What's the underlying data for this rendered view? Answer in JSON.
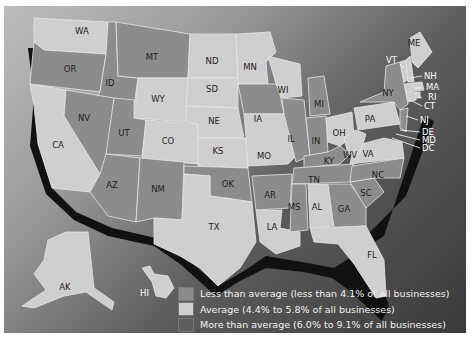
{
  "map": {
    "title": "Share of businesses by state",
    "colors": {
      "less": "#8c8c8c",
      "average": "#cfcfcf",
      "more": "#5e5e5e",
      "coast_shadow": "#111111",
      "background_light": "#bdbdbd",
      "background_dark": "#3a3a3a"
    },
    "states": {
      "WA": {
        "label": "WA",
        "category": "average"
      },
      "OR": {
        "label": "OR",
        "category": "less"
      },
      "CA": {
        "label": "CA",
        "category": "average"
      },
      "ID": {
        "label": "ID",
        "category": "less"
      },
      "NV": {
        "label": "NV",
        "category": "less"
      },
      "MT": {
        "label": "MT",
        "category": "less"
      },
      "WY": {
        "label": "WY",
        "category": "average"
      },
      "UT": {
        "label": "UT",
        "category": "less"
      },
      "CO": {
        "label": "CO",
        "category": "average"
      },
      "AZ": {
        "label": "AZ",
        "category": "less"
      },
      "NM": {
        "label": "NM",
        "category": "less"
      },
      "ND": {
        "label": "ND",
        "category": "average"
      },
      "SD": {
        "label": "SD",
        "category": "average"
      },
      "NE": {
        "label": "NE",
        "category": "average"
      },
      "KS": {
        "label": "KS",
        "category": "average"
      },
      "OK": {
        "label": "OK",
        "category": "less"
      },
      "TX": {
        "label": "TX",
        "category": "average"
      },
      "MN": {
        "label": "MN",
        "category": "average"
      },
      "IA": {
        "label": "IA",
        "category": "less"
      },
      "MO": {
        "label": "MO",
        "category": "average"
      },
      "AR": {
        "label": "AR",
        "category": "less"
      },
      "LA": {
        "label": "LA",
        "category": "average"
      },
      "WI": {
        "label": "WI",
        "category": "average"
      },
      "IL": {
        "label": "IL",
        "category": "less"
      },
      "MI": {
        "label": "MI",
        "category": "less"
      },
      "IN": {
        "label": "IN",
        "category": "less"
      },
      "OH": {
        "label": "OH",
        "category": "average"
      },
      "KY": {
        "label": "KY",
        "category": "less"
      },
      "TN": {
        "label": "TN",
        "category": "less"
      },
      "MS": {
        "label": "MS",
        "category": "less"
      },
      "AL": {
        "label": "AL",
        "category": "average"
      },
      "GA": {
        "label": "GA",
        "category": "less"
      },
      "FL": {
        "label": "FL",
        "category": "average"
      },
      "SC": {
        "label": "SC",
        "category": "less"
      },
      "NC": {
        "label": "NC",
        "category": "less"
      },
      "VA": {
        "label": "VA",
        "category": "average"
      },
      "WV": {
        "label": "WV",
        "category": "average"
      },
      "PA": {
        "label": "PA",
        "category": "average"
      },
      "NY": {
        "label": "NY",
        "category": "less"
      },
      "VT": {
        "label": "VT",
        "category": "average"
      },
      "NH": {
        "label": "NH",
        "category": "average"
      },
      "ME": {
        "label": "ME",
        "category": "average"
      },
      "MA": {
        "label": "MA",
        "category": "average"
      },
      "RI": {
        "label": "RI",
        "category": "average"
      },
      "CT": {
        "label": "CT",
        "category": "average"
      },
      "NJ": {
        "label": "NJ",
        "category": "less"
      },
      "DE": {
        "label": "DE",
        "category": "average"
      },
      "MD": {
        "label": "MD",
        "category": "average"
      },
      "DC": {
        "label": "DC",
        "category": "average"
      },
      "AK": {
        "label": "AK",
        "category": "average"
      },
      "HI": {
        "label": "HI",
        "category": "average"
      }
    }
  },
  "legend": {
    "items": [
      {
        "key": "less",
        "label": "Less than average (less than 4.1% of all businesses)"
      },
      {
        "key": "average",
        "label": "Average (4.4% to 5.8% of all businesses)"
      },
      {
        "key": "more",
        "label": "More than average (6.0% to 9.1% of all businesses)"
      }
    ]
  }
}
